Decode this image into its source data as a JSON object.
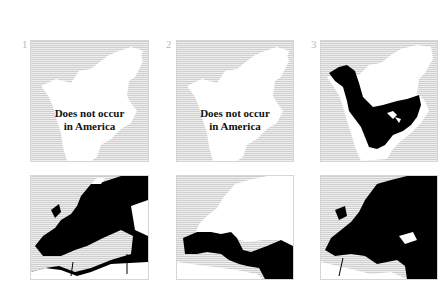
{
  "panels": [
    {
      "number": "1",
      "region": "North America",
      "label_line1": "Does not occur",
      "label_line2": "in America",
      "range": "none"
    },
    {
      "number": "2",
      "region": "North America",
      "label_line1": "Does not occur",
      "label_line2": "in America",
      "range": "none"
    },
    {
      "number": "3",
      "region": "North America",
      "range": "western Alaska, western and central Canada, central and eastern United States"
    },
    {
      "number": "",
      "region": "Europe",
      "range": "most of Europe except far north and parts of North Africa"
    },
    {
      "number": "",
      "region": "Europe",
      "range": "Mediterranean coasts, Iberia, Italy, Balkans, Turkey and Middle East"
    },
    {
      "number": "",
      "region": "Europe",
      "range": "most of Europe and Russia, except far north"
    }
  ],
  "colors": {
    "range": "#000000",
    "land": "#ffffff",
    "sea_stripe": "#cfcfcf",
    "number": "#b9b9b9"
  }
}
